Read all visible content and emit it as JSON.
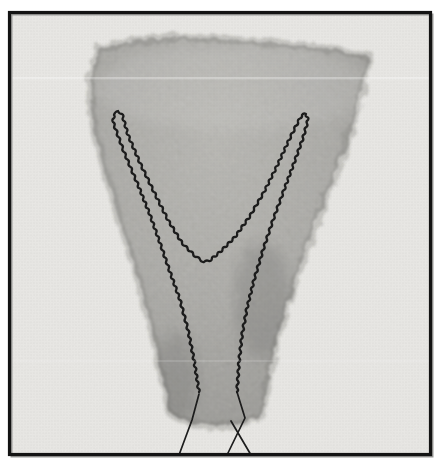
{
  "figure": {
    "type": "photograph"
  },
  "colors": {
    "page_background": "#ffffff",
    "frame_border": "#131313",
    "frame_shadow": "#9a9a97",
    "photo_background": "#e9e8e5",
    "felt_light": "#b4b3ae",
    "felt_mid": "#a5a4a0",
    "felt_dark": "#8d8c88",
    "thread": "#1b1b1b"
  },
  "stitches": {
    "running_suture": [
      [
        199,
        392
      ],
      [
        194,
        360
      ],
      [
        188,
        330
      ],
      [
        180,
        300
      ],
      [
        170,
        272
      ],
      [
        160,
        243
      ],
      [
        150,
        215
      ],
      [
        138,
        185
      ],
      [
        124,
        152
      ],
      [
        113,
        122
      ],
      [
        114,
        115
      ],
      [
        118,
        111
      ],
      [
        122,
        114
      ],
      [
        128,
        135
      ],
      [
        140,
        163
      ],
      [
        154,
        192
      ],
      [
        168,
        220
      ],
      [
        182,
        243
      ],
      [
        196,
        257
      ],
      [
        204,
        262
      ],
      [
        209,
        261
      ],
      [
        220,
        252
      ],
      [
        235,
        237
      ],
      [
        250,
        216
      ],
      [
        264,
        192
      ],
      [
        277,
        166
      ],
      [
        289,
        140
      ],
      [
        298,
        122
      ],
      [
        302,
        115
      ],
      [
        306,
        114
      ],
      [
        308,
        120
      ],
      [
        303,
        138
      ],
      [
        294,
        163
      ],
      [
        284,
        190
      ],
      [
        273,
        220
      ],
      [
        263,
        250
      ],
      [
        254,
        280
      ],
      [
        247,
        308
      ],
      [
        242,
        335
      ],
      [
        239,
        362
      ],
      [
        237,
        392
      ]
    ],
    "free_thread_ends": [
      [
        [
          199,
          394
        ],
        [
          192,
          420
        ],
        [
          179,
          455
        ]
      ],
      [
        [
          237,
          392
        ],
        [
          245,
          418
        ],
        [
          227,
          455
        ]
      ],
      [
        [
          231,
          421
        ],
        [
          251,
          455
        ]
      ]
    ]
  }
}
